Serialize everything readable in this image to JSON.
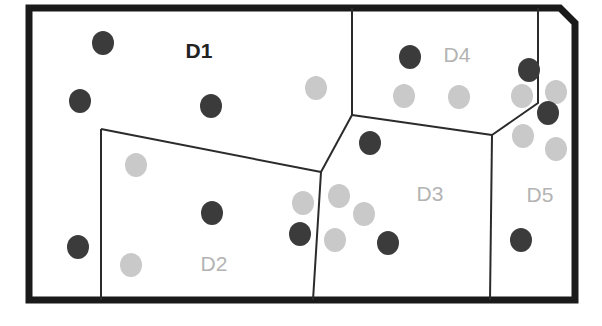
{
  "figure": {
    "canvas": {
      "width": 602,
      "height": 326
    },
    "background_color": "#ffffff",
    "outer_border": {
      "name": "outer-boundary",
      "color": "#1a1a1a",
      "stroke_width": 7,
      "points": "29,8 560,8 575,23 575,300 29,300"
    },
    "divider_color": "#2b2b2b",
    "divider_width": 2
  },
  "regions": [
    {
      "id": "D1",
      "label": "D1",
      "label_style": "dark",
      "label_x": 199,
      "label_y": 58,
      "boundary": "29,8 352,8 352,115 321,172 101,172 101,129 101,172 29,172"
    },
    {
      "id": "D2",
      "label": "D2",
      "label_style": "light",
      "label_x": 214,
      "label_y": 271,
      "boundary": "101,129 321,172 313,300 101,300"
    },
    {
      "id": "D3",
      "label": "D3",
      "label_style": "light",
      "label_x": 430,
      "label_y": 201,
      "boundary": "321,172 352,115 492,135 490,300 313,300"
    },
    {
      "id": "D4",
      "label": "D4",
      "label_style": "light",
      "label_x": 457,
      "label_y": 62,
      "boundary": "352,8 538,8 538,103 492,135 352,115"
    },
    {
      "id": "D5",
      "label": "D5",
      "label_style": "light",
      "label_x": 540,
      "label_y": 202,
      "boundary": "538,8 560,8 575,23 575,300 490,300 492,135 538,103"
    }
  ],
  "dividers": [
    {
      "name": "divider-d1-d4",
      "path": "M 352,8 L 352,115"
    },
    {
      "name": "divider-d1-d2",
      "path": "M 101,129 L 321,172"
    },
    {
      "name": "divider-d2-left-edge",
      "path": "M 101,129 L 101,300"
    },
    {
      "name": "divider-d2-d3",
      "path": "M 321,172 L 313,300"
    },
    {
      "name": "divider-d1-d3",
      "path": "M 352,115 L 321,172"
    },
    {
      "name": "divider-d3-d4",
      "path": "M 352,115 L 492,135"
    },
    {
      "name": "divider-d4-d5",
      "path": "M 538,8 L 538,103 L 492,135"
    },
    {
      "name": "divider-d3-d5",
      "path": "M 492,135 L 490,300"
    }
  ],
  "point_colors": {
    "dark": "#3b3b3b",
    "light": "#c9c9c9"
  },
  "point_radius": 11,
  "points": [
    {
      "name": "point-d1-dark-1",
      "x": 103,
      "y": 43,
      "color": "dark",
      "region": "D1"
    },
    {
      "name": "point-d1-dark-2",
      "x": 80,
      "y": 101,
      "color": "dark",
      "region": "D1"
    },
    {
      "name": "point-d1-dark-3",
      "x": 211,
      "y": 106,
      "color": "dark",
      "region": "D1"
    },
    {
      "name": "point-d1-light-1",
      "x": 316,
      "y": 88,
      "color": "light",
      "region": "D1"
    },
    {
      "name": "point-d1-dark-4",
      "x": 78,
      "y": 247,
      "color": "dark",
      "region": "D1"
    },
    {
      "name": "point-d2-light-1",
      "x": 136,
      "y": 165,
      "color": "light",
      "region": "D2"
    },
    {
      "name": "point-d2-dark-1",
      "x": 212,
      "y": 213,
      "color": "dark",
      "region": "D2"
    },
    {
      "name": "point-d2-light-2",
      "x": 131,
      "y": 265,
      "color": "light",
      "region": "D2"
    },
    {
      "name": "point-d2-light-3",
      "x": 303,
      "y": 203,
      "color": "light",
      "region": "D2"
    },
    {
      "name": "point-d2-dark-2",
      "x": 300,
      "y": 234,
      "color": "dark",
      "region": "D2"
    },
    {
      "name": "point-d3-dark-1",
      "x": 370,
      "y": 143,
      "color": "dark",
      "region": "D3"
    },
    {
      "name": "point-d3-light-1",
      "x": 339,
      "y": 196,
      "color": "light",
      "region": "D3"
    },
    {
      "name": "point-d3-light-2",
      "x": 364,
      "y": 214,
      "color": "light",
      "region": "D3"
    },
    {
      "name": "point-d3-light-3",
      "x": 335,
      "y": 240,
      "color": "light",
      "region": "D3"
    },
    {
      "name": "point-d3-dark-2",
      "x": 388,
      "y": 243,
      "color": "dark",
      "region": "D3"
    },
    {
      "name": "point-d4-dark-1",
      "x": 410,
      "y": 57,
      "color": "dark",
      "region": "D4"
    },
    {
      "name": "point-d4-light-1",
      "x": 404,
      "y": 96,
      "color": "light",
      "region": "D4"
    },
    {
      "name": "point-d4-light-2",
      "x": 459,
      "y": 97,
      "color": "light",
      "region": "D4"
    },
    {
      "name": "point-d4-dark-2",
      "x": 529,
      "y": 70,
      "color": "dark",
      "region": "D4"
    },
    {
      "name": "point-d4-light-3",
      "x": 522,
      "y": 96,
      "color": "light",
      "region": "D4"
    },
    {
      "name": "point-d5-light-1",
      "x": 556,
      "y": 92,
      "color": "light",
      "region": "D5"
    },
    {
      "name": "point-d5-dark-1",
      "x": 548,
      "y": 113,
      "color": "dark",
      "region": "D5"
    },
    {
      "name": "point-d5-light-2",
      "x": 523,
      "y": 136,
      "color": "light",
      "region": "D5"
    },
    {
      "name": "point-d5-light-3",
      "x": 556,
      "y": 149,
      "color": "light",
      "region": "D5"
    },
    {
      "name": "point-d5-dark-2",
      "x": 521,
      "y": 240,
      "color": "dark",
      "region": "D5"
    }
  ]
}
